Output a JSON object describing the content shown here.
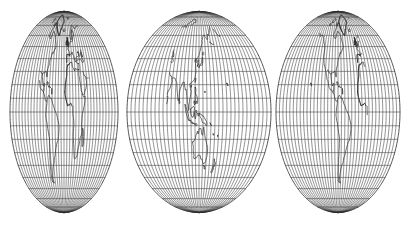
{
  "figure": {
    "kind": "interrupted-world-map",
    "background_color": "#ffffff",
    "width_px": 417,
    "height_px": 227,
    "graticule_color": "#3a3a3a",
    "coastline_color": "#161616",
    "outline_color": "#262626"
  },
  "projection": {
    "name": "interrupted elliptical (Goode / Mollweide-style)",
    "lobe_count": 3,
    "latitude_range": [
      -90,
      90
    ],
    "longitude_range": [
      -180,
      180
    ],
    "graticule_spacing_deg": 10,
    "parallel_count": 17,
    "meridian_spacing_deg": 10,
    "equator_y_px": 112,
    "north_pole_y_px": 12,
    "south_pole_y_px": 213
  },
  "lobes": [
    {
      "id": "lobe-1",
      "label": "Europe, Africa, Middle East, South Asia",
      "center_lon": -20,
      "lon_min": -100,
      "lon_max": 60,
      "center_x_px": 64,
      "half_width_px": 54,
      "regions": [
        "Europe",
        "Africa",
        "Arabian Peninsula",
        "India",
        "Madagascar",
        "Sri Lanka",
        "Greenland edge"
      ]
    },
    {
      "id": "lobe-2",
      "label": "East Asia, Australia and the Pacific Ocean",
      "center_lon": 130,
      "lon_min": 55,
      "lon_max": 205,
      "center_x_px": 199,
      "half_width_px": 72,
      "regions": [
        "Japan",
        "Kamchatka",
        "China coast",
        "Indonesia",
        "Philippines",
        "New Guinea",
        "Australia",
        "New Zealand",
        "Pacific islands"
      ]
    },
    {
      "id": "lobe-3",
      "label": "The Americas and the Atlantic Ocean",
      "center_lon": -75,
      "lon_min": -155,
      "lon_max": 5,
      "center_x_px": 338,
      "half_width_px": 62,
      "regions": [
        "North America",
        "Greenland",
        "Central America",
        "Caribbean",
        "South America",
        "West Africa edge",
        "Iberia edge"
      ]
    }
  ],
  "chart_data": {
    "type": "map",
    "xlabel": "Longitude",
    "ylabel": "Latitude",
    "grid": true,
    "legend": "none",
    "parallels_deg": [
      90,
      80,
      70,
      60,
      50,
      40,
      30,
      20,
      10,
      0,
      -10,
      -20,
      -30,
      -40,
      -50,
      -60,
      -70,
      -80,
      -90
    ],
    "meridians_step_deg": 10,
    "series": [
      {
        "name": "graticule",
        "values": []
      },
      {
        "name": "coastlines",
        "values": []
      }
    ]
  }
}
